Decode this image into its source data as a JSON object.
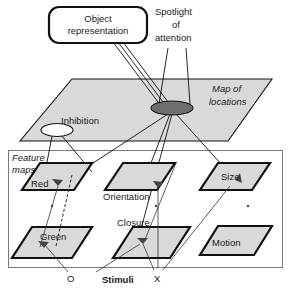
{
  "figure": {
    "title_elements": {
      "object_representation": "Object\nrepresentation",
      "object_representation_line1": "Object",
      "object_representation_line2": "representation",
      "spotlight_line1": "Spotlight",
      "spotlight_line2": "of",
      "spotlight_line3": "attention",
      "map_of_locations_line1": "Map of",
      "map_of_locations_line2": "locations",
      "inhibition": "Inhibition",
      "feature_maps_line1": "Feature",
      "feature_maps_line2": "maps",
      "stimuli": "Stimuli",
      "stimulus_o": "O",
      "stimulus_x": "X"
    },
    "feature_maps": [
      {
        "name": "Red"
      },
      {
        "name": "Orientation"
      },
      {
        "name": "Size"
      },
      {
        "name": "Green"
      },
      {
        "name": "Closure"
      },
      {
        "name": "Motion"
      }
    ],
    "colors": {
      "plane_fill": "#d9d9d9",
      "spotlight_fill": "#6e6e6e",
      "inhibition_fill": "#ffffff",
      "stroke": "#111111",
      "frame": "#7a7a7a",
      "background": "#ffffff"
    }
  }
}
